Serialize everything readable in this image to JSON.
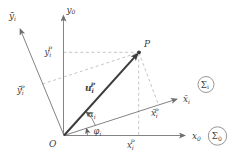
{
  "figure": {
    "colors": {
      "background": "#ffffff",
      "axis": "#757575",
      "dashed": "#b6b6b6",
      "vector": "#3c3c3c",
      "text": "#3d3d3d"
    },
    "labels": {
      "y0": {
        "base": "y",
        "sub": "0"
      },
      "x0": {
        "base": "x",
        "sub": "0"
      },
      "ybar_i": {
        "base": "ȳ",
        "sub": "i"
      },
      "xbar_i": {
        "base": "x̄",
        "sub": "i"
      },
      "point_p": "P",
      "origin": "O",
      "u_vec": {
        "base": "u",
        "sub": "i",
        "sup": "P"
      },
      "y_coord": {
        "base": "y",
        "sub": "i",
        "sup": "P"
      },
      "x_coord": {
        "base": "x",
        "sub": "i",
        "sup": "P"
      },
      "ybar_coord": {
        "base": "ȳ",
        "sub": "i",
        "sup": "P"
      },
      "xbar_coord": {
        "base": "x̄",
        "sub": "i",
        "sup": "P"
      },
      "alpha": {
        "base": "α",
        "sub": "i"
      },
      "phi": {
        "base": "φ",
        "sub": "i"
      },
      "frame_i": {
        "base": "Σ",
        "sub": "i"
      },
      "frame_0": {
        "base": "Σ",
        "sub": "0"
      }
    }
  }
}
